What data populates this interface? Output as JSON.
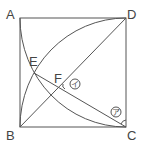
{
  "diagram": {
    "type": "geometry",
    "labels": {
      "A": "A",
      "B": "B",
      "C": "C",
      "D": "D",
      "E": "E",
      "F": "F"
    },
    "angle_marks": {
      "a": "ア",
      "i": "イ"
    },
    "stroke_color": "#555555"
  }
}
